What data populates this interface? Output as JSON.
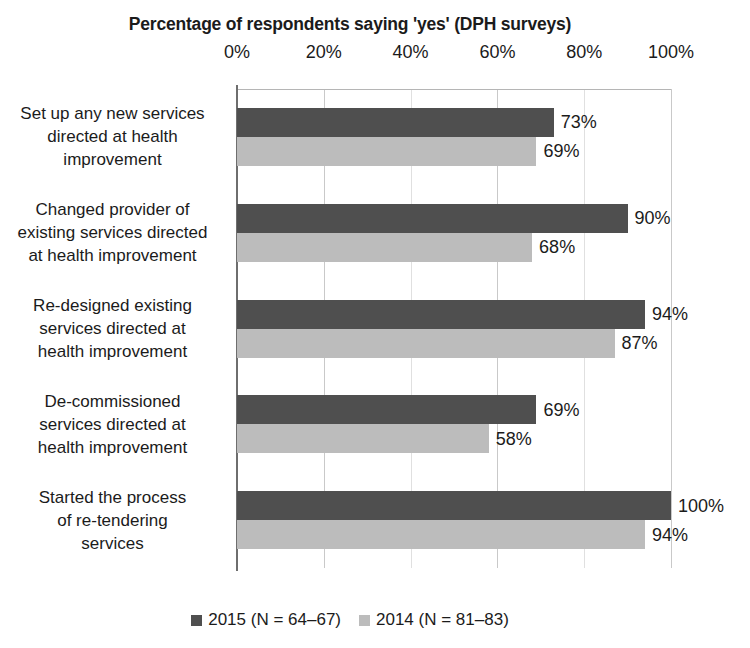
{
  "chart_data": {
    "type": "bar",
    "orientation": "horizontal",
    "title": "Percentage of respondents saying 'yes' (DPH surveys)",
    "xlabel": "",
    "ylabel": "",
    "xlim": [
      0,
      100
    ],
    "xticks": [
      0,
      20,
      40,
      60,
      80,
      100
    ],
    "xtick_labels": [
      "0%",
      "20%",
      "40%",
      "60%",
      "80%",
      "100%"
    ],
    "grid": true,
    "legend_position": "bottom",
    "categories": [
      "Set up any new services directed at health improvement",
      "Changed provider of existing services directed at health improvement",
      "Re-designed existing services directed at health improvement",
      "De-commissioned services directed at health improvement",
      "Started the process of re-tendering services"
    ],
    "category_lines": [
      [
        "Set up any new services",
        "directed at health",
        "improvement"
      ],
      [
        "Changed provider of",
        "existing services directed",
        "at health improvement"
      ],
      [
        "Re-designed existing",
        "services directed at",
        "health improvement"
      ],
      [
        "De-commissioned",
        "services directed at",
        "health improvement"
      ],
      [
        "Started the process",
        "of re-tendering",
        "services"
      ]
    ],
    "series": [
      {
        "name": "2015 (N = 64–67)",
        "color": "#4f4f4f",
        "values": [
          73,
          90,
          94,
          69,
          100
        ],
        "value_labels": [
          "73%",
          "90%",
          "94%",
          "69%",
          "100%"
        ]
      },
      {
        "name": "2014 (N = 81–83)",
        "color": "#bcbcbc",
        "values": [
          69,
          68,
          87,
          58,
          94
        ],
        "value_labels": [
          "69%",
          "68%",
          "87%",
          "58%",
          "94%"
        ]
      }
    ]
  },
  "legend": {
    "items": [
      {
        "label": "2015 (N = 64–67)",
        "color": "#4f4f4f"
      },
      {
        "label": "2014 (N = 81–83)",
        "color": "#bcbcbc"
      }
    ]
  }
}
